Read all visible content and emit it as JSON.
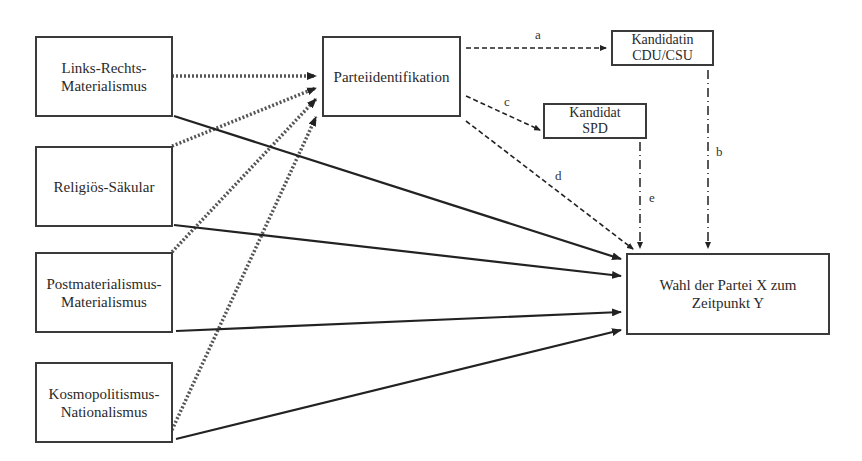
{
  "diagram": {
    "nodes": {
      "links_rechts": {
        "line1": "Links-Rechts-",
        "line2": "Materialismus"
      },
      "religioes": {
        "line1": "Religiös-Säkular"
      },
      "postmat": {
        "line1": "Postmaterialismus-",
        "line2": "Materialismus"
      },
      "kosmo": {
        "line1": "Kosmopolitismus-",
        "line2": "Nationalismus"
      },
      "parteiid": {
        "line1": "Parteiidentifikation"
      },
      "kandidatin": {
        "line1": "Kandidatin",
        "line2": "CDU/CSU"
      },
      "kandidat": {
        "line1": "Kandidat",
        "line2": "SPD"
      },
      "wahl": {
        "line1": "Wahl der Partei X zum",
        "line2": "Zeitpunkt Y"
      }
    },
    "edge_labels": {
      "a": "a",
      "b": "b",
      "c": "c",
      "d": "d",
      "e": "e"
    },
    "edges": [
      {
        "from": "Links-Rechts-Materialismus",
        "to": "Parteiidentifikation",
        "style": "dotted"
      },
      {
        "from": "Religiös-Säkular",
        "to": "Parteiidentifikation",
        "style": "dotted"
      },
      {
        "from": "Postmaterialismus-Materialismus",
        "to": "Parteiidentifikation",
        "style": "dotted"
      },
      {
        "from": "Kosmopolitismus-Nationalismus",
        "to": "Parteiidentifikation",
        "style": "dotted"
      },
      {
        "from": "Links-Rechts-Materialismus",
        "to": "Wahl der Partei X zum Zeitpunkt Y",
        "style": "solid"
      },
      {
        "from": "Religiös-Säkular",
        "to": "Wahl der Partei X zum Zeitpunkt Y",
        "style": "solid"
      },
      {
        "from": "Postmaterialismus-Materialismus",
        "to": "Wahl der Partei X zum Zeitpunkt Y",
        "style": "solid"
      },
      {
        "from": "Kosmopolitismus-Nationalismus",
        "to": "Wahl der Partei X zum Zeitpunkt Y",
        "style": "solid"
      },
      {
        "from": "Parteiidentifikation",
        "to": "Kandidatin CDU/CSU",
        "style": "dashed",
        "label": "a"
      },
      {
        "from": "Kandidatin CDU/CSU",
        "to": "Wahl der Partei X zum Zeitpunkt Y",
        "style": "dash-dot",
        "label": "b"
      },
      {
        "from": "Parteiidentifikation",
        "to": "Kandidat SPD",
        "style": "dashed",
        "label": "c"
      },
      {
        "from": "Parteiidentifikation",
        "to": "Wahl der Partei X zum Zeitpunkt Y",
        "style": "dashed",
        "label": "d"
      },
      {
        "from": "Kandidat SPD",
        "to": "Wahl der Partei X zum Zeitpunkt Y",
        "style": "dash-dot",
        "label": "e"
      }
    ],
    "colors": {
      "line": "#2a2a2a",
      "dotted": "#555555",
      "background": "#ffffff"
    }
  }
}
